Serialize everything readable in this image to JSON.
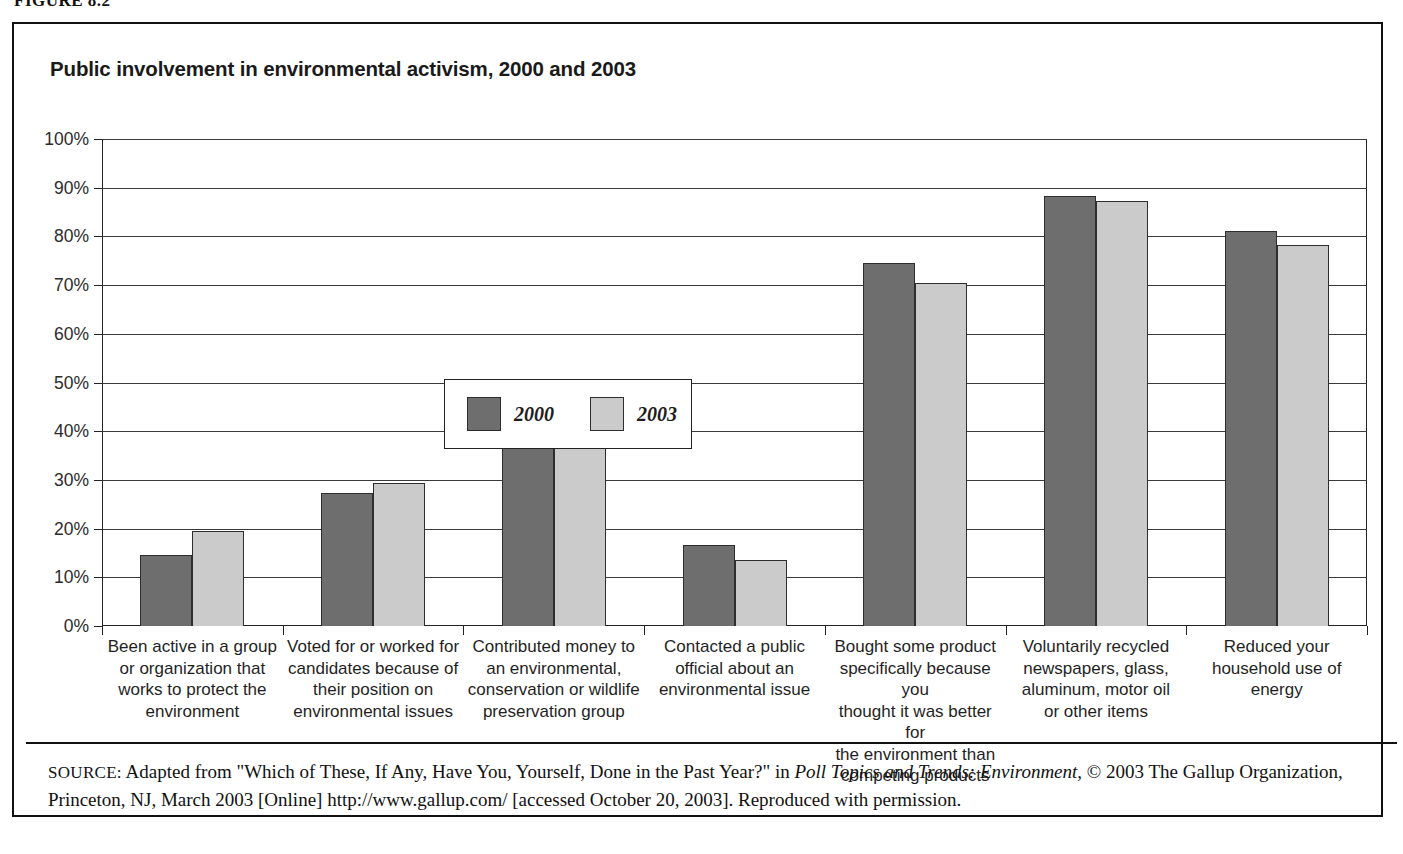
{
  "figure": {
    "caption": "FIGURE 8.2"
  },
  "chart_title": "Public involvement in environmental activism, 2000 and 2003",
  "legend": {
    "entries": [
      {
        "label": "2000",
        "color": "#6e6e6e"
      },
      {
        "label": "2003",
        "color": "#cbcbcb"
      }
    ]
  },
  "source": {
    "label": "SOURCE:",
    "text_before_italic": " Adapted from \"Which of These, If Any, Have You, Yourself, Done in the Past Year?\" in ",
    "italic_title": "Poll Topics and Trends: Environment,",
    "text_after_italic": " © 2003 The Gallup Organization, Princeton, NJ, March 2003 [Online] http://www.gallup.com/ [accessed October 20, 2003]. Reproduced with permission."
  },
  "chart_data": {
    "type": "bar",
    "title": "Public involvement in environmental activism, 2000 and 2003",
    "xlabel": "",
    "ylabel": "",
    "ylim": [
      0,
      100
    ],
    "yticks": [
      "0%",
      "10%",
      "20%",
      "30%",
      "40%",
      "50%",
      "60%",
      "70%",
      "80%",
      "90%",
      "100%"
    ],
    "ytick_values": [
      0,
      10,
      20,
      30,
      40,
      50,
      60,
      70,
      80,
      90,
      100
    ],
    "grid": true,
    "legend_position": "inside-upper-left",
    "categories": [
      "Been active in a group or organization that works to protect the environment",
      "Voted for or worked for candidates because of their position on environmental issues",
      "Contributed money to an environmental, conservation or wildlife preservation group",
      "Contacted a public official about an environmental issue",
      "Bought some product specifically because you thought it was better for the environment than competing products",
      "Voluntarily recycled newspapers, glass, aluminum, motor oil or other items",
      "Reduced your household use of energy"
    ],
    "category_lines": [
      [
        "Been active in a group",
        "or organization that",
        "works to protect the",
        "environment"
      ],
      [
        "Voted for or worked for",
        "candidates because of",
        "their position on",
        "environmental issues"
      ],
      [
        "Contributed money to",
        "an environmental,",
        "conservation or wildlife",
        "preservation group"
      ],
      [
        "Contacted a public",
        "official about an",
        "environmental issue"
      ],
      [
        "Bought some product",
        "specifically because you",
        "thought it was better for",
        "the environment than",
        "competing products"
      ],
      [
        "Voluntarily recycled",
        "newspapers, glass,",
        "aluminum, motor oil",
        "or other items"
      ],
      [
        "Reduced your",
        "household use of",
        "energy"
      ]
    ],
    "series": [
      {
        "name": "2000",
        "color": "#6e6e6e",
        "values": [
          14.6,
          27.3,
          39.2,
          16.7,
          74.6,
          88.3,
          81.2
        ]
      },
      {
        "name": "2003",
        "color": "#cbcbcb",
        "values": [
          19.5,
          29.3,
          41.0,
          13.6,
          70.4,
          87.2,
          78.3
        ]
      }
    ]
  }
}
